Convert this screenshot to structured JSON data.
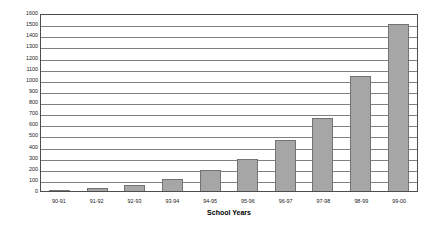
{
  "chart_data": {
    "type": "bar",
    "title": "",
    "xlabel": "School Years",
    "ylabel": "",
    "categories": [
      "90-91",
      "91-92",
      "92-93",
      "93-94",
      "94-95",
      "95-96",
      "96-97",
      "97-98",
      "98-99",
      "99-00"
    ],
    "values": [
      10,
      30,
      50,
      110,
      190,
      290,
      460,
      660,
      1030,
      1500
    ],
    "ylim": [
      0,
      1600
    ],
    "ytick_step": 100,
    "yticks": [
      0,
      100,
      200,
      300,
      400,
      500,
      600,
      700,
      800,
      900,
      1000,
      1100,
      1200,
      1300,
      1400,
      1500,
      1600
    ],
    "ytick_labels": [
      "0",
      "100",
      "200",
      "300",
      "400",
      "500",
      "600",
      "700",
      "800",
      "900",
      "1000",
      "1100",
      "1200",
      "1300",
      "1400",
      "1500",
      "1600"
    ],
    "grid": true,
    "grid_axis": "y",
    "legend": false,
    "legend_position": "none",
    "series": [
      {
        "name": "",
        "values": [
          10,
          30,
          50,
          110,
          190,
          290,
          460,
          660,
          1030,
          1500
        ]
      }
    ],
    "colors": {
      "bar_fill": "#a6a6a6",
      "bar_border": "#737373",
      "gridline": "#808080",
      "plot_border": "#4d4d4d",
      "background": "#ffffff",
      "text": "#1a1a1a"
    }
  }
}
